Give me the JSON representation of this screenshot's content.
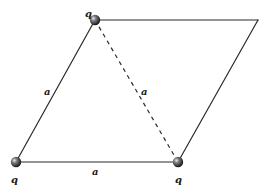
{
  "diagram": {
    "type": "rhombus-charge-configuration",
    "vertices": {
      "top_left": {
        "x": 95,
        "y": 20,
        "has_charge": true
      },
      "top_right": {
        "x": 258,
        "y": 20,
        "has_charge": false
      },
      "bottom_left": {
        "x": 16,
        "y": 162,
        "has_charge": true
      },
      "bottom_right": {
        "x": 178,
        "y": 162,
        "has_charge": true
      }
    },
    "charges": [
      {
        "id": "top-left",
        "label": "q",
        "x": 95,
        "y": 20,
        "label_x": 85,
        "label_y": 17
      },
      {
        "id": "bottom-left",
        "label": "q",
        "x": 16,
        "y": 162,
        "label_x": 11,
        "label_y": 183
      },
      {
        "id": "bottom-right",
        "label": "q",
        "x": 178,
        "y": 162,
        "label_x": 175,
        "label_y": 183
      }
    ],
    "edges": [
      {
        "id": "left-side",
        "from": "bottom_left",
        "to": "top_left",
        "style": "solid",
        "label": "a",
        "label_x": 44,
        "label_y": 95
      },
      {
        "id": "bottom-side",
        "from": "bottom_left",
        "to": "bottom_right",
        "style": "solid",
        "label": "a",
        "label_x": 92,
        "label_y": 175
      },
      {
        "id": "diagonal",
        "from": "top_left",
        "to": "bottom_right",
        "style": "dashed",
        "label": "a",
        "label_x": 141,
        "label_y": 95
      },
      {
        "id": "top-side",
        "from": "top_left",
        "to": "top_right",
        "style": "solid",
        "label": ""
      },
      {
        "id": "right-side",
        "from": "top_right",
        "to": "bottom_right",
        "style": "solid",
        "label": ""
      }
    ],
    "labels": {
      "charge_symbol": "q",
      "side_length_symbol": "a"
    }
  }
}
